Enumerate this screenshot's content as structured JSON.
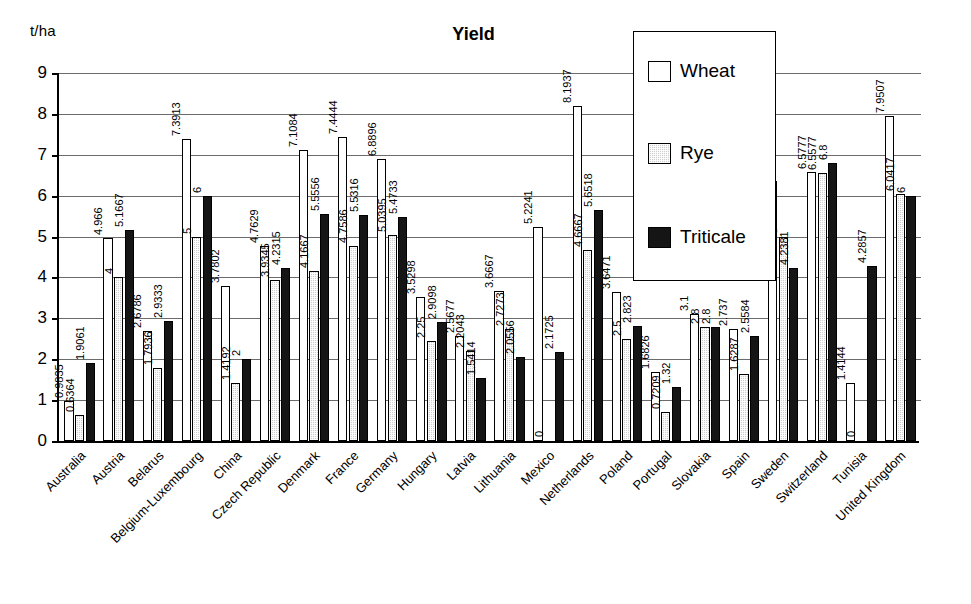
{
  "chart_data": {
    "type": "bar",
    "title": "Yield",
    "xlabel": "",
    "ylabel": "t/ha",
    "ylim": [
      0,
      9
    ],
    "yticks": [
      0,
      1,
      2,
      3,
      4,
      5,
      6,
      7,
      8,
      9
    ],
    "grid": true,
    "legend_position": "top-right-inset",
    "legend": [
      "Wheat",
      "Rye",
      "Triticale"
    ],
    "categories": [
      "Australia",
      "Austria",
      "Belarus",
      "Belgium-Luxembourg",
      "China",
      "Czech Republic",
      "Denmark",
      "France",
      "Germany",
      "Hungary",
      "Latvia",
      "Lithuania",
      "Mexico",
      "Netherlands",
      "Poland",
      "Portugal",
      "Slovakia",
      "Spain",
      "Sweden",
      "Switzerland",
      "Tunisia",
      "United Kingdom"
    ],
    "series": [
      {
        "name": "Wheat",
        "color": "#ffffff",
        "values": [
          0.9835,
          4.966,
          2.6786,
          7.3913,
          3.7802,
          4.7629,
          7.1084,
          7.4444,
          6.8896,
          3.5298,
          2.5677,
          3.6667,
          5.2241,
          8.1937,
          3.6471,
          1.6826,
          3.1,
          2.737,
          6.3559,
          6.5777,
          1.4144,
          7.9507
        ],
        "labels": [
          "0.9835",
          "4.966",
          "2.6786",
          "7.3913",
          "3.7802",
          "4.7629",
          "7.1084",
          "7.4444",
          "6.8896",
          "3.5298",
          "2.5677",
          "3.6667",
          "5.2241",
          "8.1937",
          "3.6471",
          "1.6826",
          "3.1",
          "2.737",
          "6.3559",
          "6.5777",
          "1.4144",
          "7.9507"
        ]
      },
      {
        "name": "Rye",
        "color": "#cfcfcf",
        "values": [
          0.6364,
          4,
          1.7936,
          5,
          1.4192,
          3.9345,
          4.1667,
          4.7586,
          5.0395,
          2.45,
          2.2043,
          2.7273,
          0,
          4.6667,
          2.5,
          0.7209,
          2.8,
          1.6287,
          5,
          6.5577,
          0,
          6.0417
        ],
        "labels": [
          "0.6364",
          "4",
          "1.7936",
          "5",
          "1.4192",
          "3.9345",
          "4.1667",
          "4.7586",
          "5.0395",
          "2.25",
          "2.2043",
          "2.7273",
          "0",
          "4.6667",
          "2.5",
          "0.7209",
          "2.8",
          "1.6287",
          "5",
          "6.5577",
          "0",
          "6.0417"
        ]
      },
      {
        "name": "Triticale",
        "color": "#151515",
        "values": [
          1.9061,
          5.1667,
          2.9333,
          6,
          2,
          4.2315,
          5.5556,
          5.5316,
          5.4733,
          2.9098,
          1.5414,
          2.0556,
          2.1725,
          5.6518,
          2.823,
          1.32,
          2.8,
          2.5584,
          4.2381,
          6.8,
          4.2857,
          6
        ],
        "labels": [
          "1.9061",
          "5.1667",
          "2.9333",
          "6",
          "2",
          "4.2315",
          "5.5556",
          "5.5316",
          "5.4733",
          "2.9098",
          "1.5414",
          "2.0556",
          "2.1725",
          "5.6518",
          "2.823",
          "1.32",
          "2.8",
          "2.5584",
          "4.2381",
          "6.8",
          "4.2857",
          "6"
        ]
      }
    ]
  }
}
